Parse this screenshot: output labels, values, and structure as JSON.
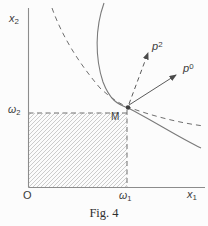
{
  "figure": {
    "caption": "Fig. 4",
    "axes": {
      "y_label": {
        "base": "x",
        "sub": "2"
      },
      "x_label": {
        "base": "x",
        "sub": "1"
      },
      "origin": "O"
    },
    "endowment": {
      "omega2": {
        "base": "ω",
        "sub": "2"
      },
      "omega1": {
        "base": "ω",
        "sub": "1"
      },
      "point": "M"
    },
    "price_vectors": {
      "p2": {
        "base": "p",
        "sup": "2"
      },
      "p0": {
        "base": "p",
        "sup": "0"
      }
    },
    "colors": {
      "ink": "#3a3a3a",
      "curve": "#7a7a7a",
      "axis": "#8c8c8c",
      "hatch": "#b8b8b8",
      "background": "#fcfcfc"
    }
  }
}
